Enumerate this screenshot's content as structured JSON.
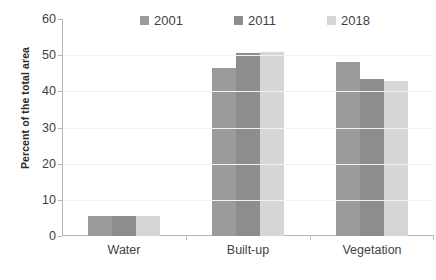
{
  "chart_data": {
    "type": "bar",
    "title": "",
    "subtitle": "",
    "xlabel": "",
    "ylabel": "Percent of the total  area",
    "categories": [
      "Water",
      "Built-up",
      "Vegetation"
    ],
    "series": [
      {
        "name": "2001",
        "color": "#9b9b9b",
        "values": [
          5.5,
          46.5,
          48.0
        ]
      },
      {
        "name": "2011",
        "color": "#8d8d8d",
        "values": [
          5.5,
          50.6,
          43.3
        ]
      },
      {
        "name": "2018",
        "color": "#d6d6d6",
        "values": [
          5.5,
          50.8,
          42.9
        ]
      }
    ],
    "ylim": [
      0,
      60
    ],
    "yticks": [
      0,
      10,
      20,
      30,
      40,
      50,
      60
    ],
    "ytick_labels": [
      "0",
      "10",
      "20",
      "30",
      "40",
      "50",
      "60"
    ],
    "grid": "horizontal-faint",
    "legend_position": "top-center",
    "axis_color": "#b5b5b5",
    "text_color": "#3f3f3f",
    "background": "#ffffff"
  }
}
